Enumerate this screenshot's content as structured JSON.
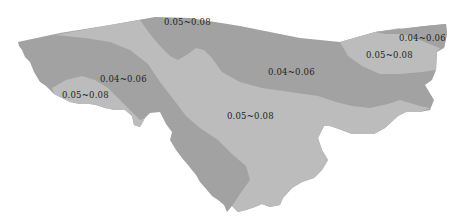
{
  "map": {
    "legend_classes": [
      {
        "name": "dark",
        "range": "0.04~0.06",
        "color": "#a2a2a2"
      },
      {
        "name": "light",
        "range": "0.05~0.08",
        "color": "#bcbcbc"
      }
    ],
    "labels": [
      {
        "id": "top-center",
        "text": "0.05~0.08",
        "x": 164,
        "y": 17
      },
      {
        "id": "left-middle",
        "text": "0.04~0.06",
        "x": 100,
        "y": 74
      },
      {
        "id": "left-bottom",
        "text": "0.05~0.08",
        "x": 62,
        "y": 90
      },
      {
        "id": "center-right",
        "text": "0.04~0.06",
        "x": 268,
        "y": 67
      },
      {
        "id": "center-bottom",
        "text": "0.05~0.08",
        "x": 227,
        "y": 111
      },
      {
        "id": "far-right-top",
        "text": "0.04~0.06",
        "x": 399,
        "y": 33
      },
      {
        "id": "far-right-mid",
        "text": "0.05~0.08",
        "x": 366,
        "y": 50
      }
    ]
  }
}
